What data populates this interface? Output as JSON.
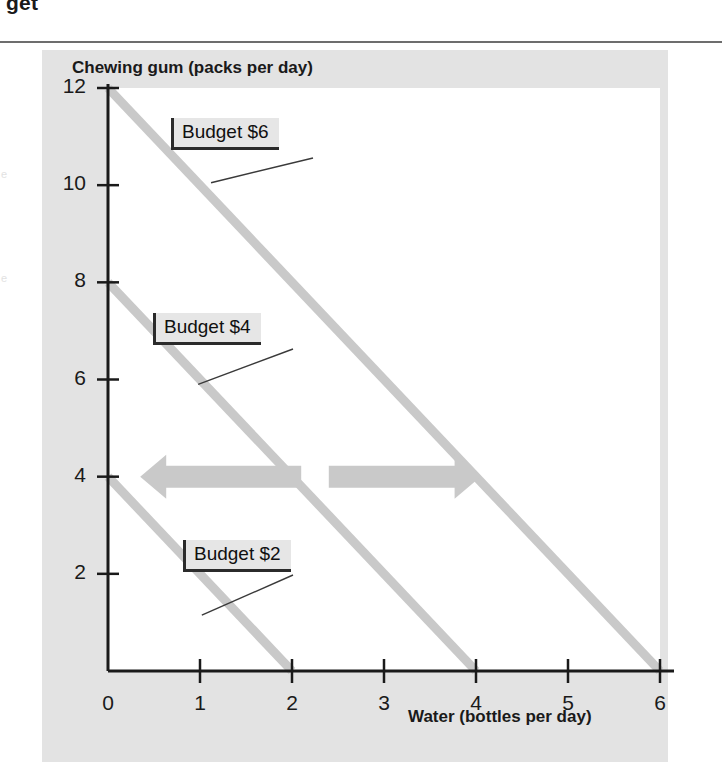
{
  "page": {
    "cropped_heading": "get",
    "margin_fragment_a": "e",
    "margin_fragment_b": "e"
  },
  "chart_data": {
    "type": "line",
    "title": "",
    "xlabel": "Water (bottles per day)",
    "ylabel": "Chewing gum (packs per day)",
    "xlim": [
      0,
      6
    ],
    "ylim": [
      0,
      12
    ],
    "xticks": [
      "0",
      "1",
      "2",
      "3",
      "4",
      "5",
      "6"
    ],
    "yticks": [
      "2",
      "4",
      "6",
      "8",
      "10",
      "12"
    ],
    "grid": false,
    "legend": "inline-callouts",
    "line_color": "#c9c9c9",
    "axis_color": "#1a1a1a",
    "plot_background": "#ffffff",
    "figure_background": "#e3e3e3",
    "arrow_color": "#c9c9c9",
    "series": [
      {
        "name": "Budget $6",
        "label": "Budget $6",
        "points": [
          [
            0,
            12
          ],
          [
            6,
            0
          ]
        ],
        "x_intercept": 6,
        "y_intercept": 12,
        "slope": -2
      },
      {
        "name": "Budget $4",
        "label": "Budget $4",
        "points": [
          [
            0,
            8
          ],
          [
            4,
            0
          ]
        ],
        "x_intercept": 4,
        "y_intercept": 8,
        "slope": -2
      },
      {
        "name": "Budget $2",
        "label": "Budget $2",
        "points": [
          [
            0,
            4
          ],
          [
            2,
            0
          ]
        ],
        "x_intercept": 2,
        "y_intercept": 4,
        "slope": -2
      }
    ],
    "annotations": [
      {
        "name": "decrease-budget-arrow",
        "type": "arrow",
        "direction": "left",
        "y": 4,
        "x_from": 2.1,
        "x_to": 0.35
      },
      {
        "name": "increase-budget-arrow",
        "type": "arrow",
        "direction": "right",
        "y": 4,
        "x_from": 2.4,
        "x_to": 4.05
      }
    ]
  }
}
